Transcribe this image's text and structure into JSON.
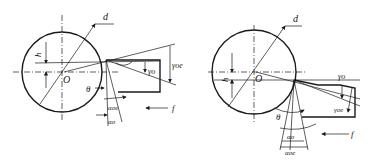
{
  "diagram": {
    "panels": [
      {
        "id": "left",
        "case": "tool above center",
        "labels": {
          "diameter": "d",
          "offset": "h",
          "center": "O",
          "rake_angle": "γo",
          "working_rake_angle": "γoe",
          "theta": "θ",
          "working_clearance_angle": "αoe",
          "clearance_angle": "αo",
          "feed": "f"
        }
      },
      {
        "id": "right",
        "case": "tool below center",
        "labels": {
          "diameter": "d",
          "offset": "h",
          "center": "O",
          "rake_angle": "γo",
          "working_rake_angle": "γoe",
          "theta": "θ",
          "clearance_angle": "αo",
          "working_clearance_angle": "αoe",
          "feed": "f"
        }
      }
    ]
  }
}
